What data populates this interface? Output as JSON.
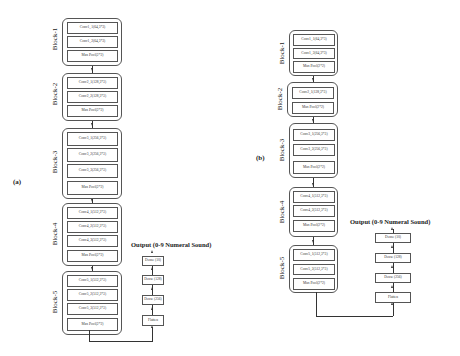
{
  "panels": [
    {
      "label": "(a)",
      "blocks": [
        {
          "name": "Block-1",
          "layers": [
            "Conv1_1(64,3*3)",
            "Conv1_2(64,3*3)",
            "Max Pool(2*2)"
          ]
        },
        {
          "name": "Block-2",
          "layers": [
            "Conv2_1(128,3*3)",
            "Conv2_2(128,3*3)",
            "Max Pool(2*2)"
          ]
        },
        {
          "name": "Block-3",
          "layers": [
            "Conv3_1(256,3*3)",
            "Conv3_2(256,3*3)",
            "Conv3_3(256,3*3)",
            "Max Pool(2*2)"
          ]
        },
        {
          "name": "Block-4",
          "layers": [
            "Conv4_1(512,3*3)",
            "Conv4_2(512,3*3)",
            "Conv4_3(512,3*3)",
            "Max Pool(2*2)"
          ]
        },
        {
          "name": "Block-5",
          "layers": [
            "Conv5_1(512,3*3)",
            "Conv5_2(512,3*3)",
            "Conv5_3(512,3*3)",
            "Max Pool(2*2)"
          ]
        }
      ],
      "output_title": "Output (0-9 Numeral Sound)",
      "head_layers": [
        "Dense (10)",
        "Dense (128)",
        "Dense (256)",
        "Flatten"
      ]
    },
    {
      "label": "(b)",
      "blocks": [
        {
          "name": "Block-1",
          "layers": [
            "Conv1_1(64,3*3)",
            "Conv1_2(64,3*3)",
            "Max Pool(2*2)"
          ]
        },
        {
          "name": "Block-2",
          "layers": [
            "Conv2_1(128,3*3)",
            "Max Pool(2*2)"
          ]
        },
        {
          "name": "Block-3",
          "layers": [
            "Conv3_1(256,3*3)",
            "Conv3_2(256,3*3)",
            "Max Pool(2*2)"
          ]
        },
        {
          "name": "Block-4",
          "layers": [
            "Conv4_1(512,3*3)",
            "Conv4_2(512,3*3)",
            "Max Pool(2*2)"
          ]
        },
        {
          "name": "Block-5",
          "layers": [
            "Conv5_1(512,3*3)",
            "Conv5_2(512,3*3)",
            "Max Pool(2*2)"
          ]
        }
      ],
      "output_title": "Output (0-9 Numeral Sound)",
      "head_layers": [
        "Dense (10)",
        "Dense (128)",
        "Dense (256)",
        "Flatten"
      ]
    }
  ]
}
